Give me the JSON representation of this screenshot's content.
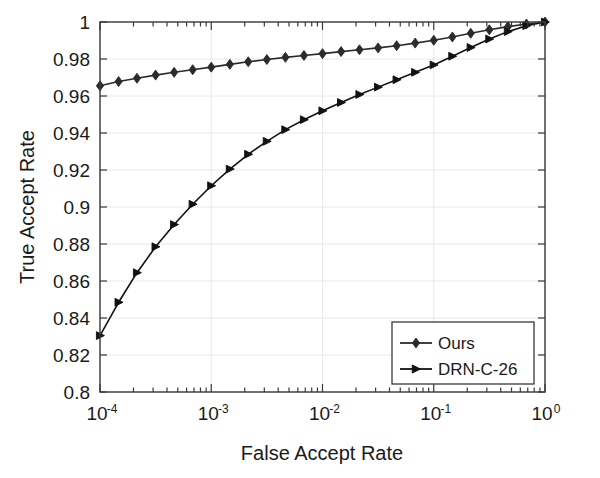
{
  "figure": {
    "title": "",
    "background_color": "#ffffff",
    "axes_color": "#3a3a3a",
    "grid_color": "#e8e8ee"
  },
  "axes": {
    "xlabel": "False Accept Rate",
    "ylabel": "True Accept Rate",
    "x_tick_labels": [
      "10-4",
      "10-3",
      "10-2",
      "10-1",
      "100"
    ],
    "x_tick_bases": [
      "10",
      "10",
      "10",
      "10",
      "10"
    ],
    "x_tick_exponents": [
      "-4",
      "-3",
      "-2",
      "-1",
      "0"
    ],
    "y_tick_labels": [
      "0.8",
      "0.82",
      "0.84",
      "0.86",
      "0.88",
      "0.9",
      "0.92",
      "0.94",
      "0.96",
      "0.98",
      "1"
    ]
  },
  "legend": {
    "position": "bottom-right",
    "entries": [
      {
        "label": "Ours",
        "marker": "diamond-marker",
        "color": "#2b2b2b"
      },
      {
        "label": "DRN-C-26",
        "marker": "right-triangle-marker",
        "color": "#111111"
      }
    ]
  },
  "chart_data": {
    "type": "line",
    "title": "",
    "xlabel": "False Accept Rate",
    "ylabel": "True Accept Rate",
    "xscale": "log",
    "yscale": "linear",
    "xlim": [
      0.0001,
      1
    ],
    "ylim": [
      0.8,
      1
    ],
    "grid": true,
    "legend_position": "lower right",
    "series": [
      {
        "name": "Ours",
        "marker": "diamond",
        "color": "#2b2b2b",
        "x": [
          0.0001,
          0.000147,
          0.000215,
          0.000316,
          0.000464,
          0.000681,
          0.001,
          0.00147,
          0.00215,
          0.00316,
          0.00464,
          0.00681,
          0.01,
          0.0147,
          0.0215,
          0.0316,
          0.0464,
          0.0681,
          0.1,
          0.147,
          0.215,
          0.316,
          0.464,
          0.681,
          1.0
        ],
        "y": [
          0.9655,
          0.9678,
          0.9696,
          0.9713,
          0.9728,
          0.9742,
          0.9756,
          0.9771,
          0.9785,
          0.9797,
          0.9809,
          0.9819,
          0.9829,
          0.984,
          0.985,
          0.986,
          0.9872,
          0.9886,
          0.9901,
          0.9919,
          0.9939,
          0.9958,
          0.9975,
          0.9989,
          1.0
        ]
      },
      {
        "name": "DRN-C-26",
        "marker": "right-triangle",
        "color": "#111111",
        "x": [
          0.0001,
          0.000147,
          0.000215,
          0.000316,
          0.000464,
          0.000681,
          0.001,
          0.00147,
          0.00215,
          0.00316,
          0.00464,
          0.00681,
          0.01,
          0.0147,
          0.0215,
          0.0316,
          0.0464,
          0.0681,
          0.1,
          0.147,
          0.215,
          0.316,
          0.464,
          0.681,
          1.0
        ],
        "y": [
          0.8305,
          0.8485,
          0.8645,
          0.8785,
          0.8905,
          0.9015,
          0.9115,
          0.9205,
          0.9285,
          0.9355,
          0.9418,
          0.9472,
          0.952,
          0.9565,
          0.9608,
          0.9648,
          0.9688,
          0.9728,
          0.9768,
          0.9815,
          0.9862,
          0.9908,
          0.9948,
          0.998,
          1.0
        ]
      }
    ]
  }
}
